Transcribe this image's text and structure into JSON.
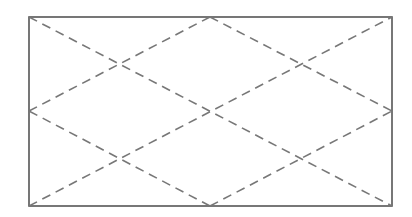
{
  "diagram": {
    "type": "rectangle-diamond-lattice",
    "colors": {
      "background": "#ffffff",
      "frame": "#555555",
      "dashed_lines": "#777777"
    },
    "frame": {
      "x": 29,
      "y": 17,
      "width": 363,
      "height": 189
    },
    "dash_pattern": "9,6",
    "lines": [
      {
        "id": "diagonal-tl-br",
        "x1": 29,
        "y1": 17,
        "x2": 392,
        "y2": 206
      },
      {
        "id": "diagonal-bl-tr",
        "x1": 29,
        "y1": 206,
        "x2": 392,
        "y2": 17
      },
      {
        "id": "diamond-top-left",
        "x1": 210,
        "y1": 17,
        "x2": 29,
        "y2": 111
      },
      {
        "id": "diamond-top-right",
        "x1": 210,
        "y1": 17,
        "x2": 392,
        "y2": 111
      },
      {
        "id": "diamond-bottom-left",
        "x1": 210,
        "y1": 206,
        "x2": 29,
        "y2": 111
      },
      {
        "id": "diamond-bottom-right",
        "x1": 210,
        "y1": 206,
        "x2": 392,
        "y2": 111
      }
    ]
  }
}
